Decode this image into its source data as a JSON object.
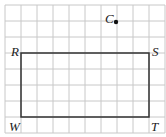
{
  "diagram": {
    "grid": {
      "cols": 10,
      "rows": 8,
      "cell": 16,
      "x0": 5,
      "y0": 5
    },
    "rectangle": {
      "vertices": [
        "R",
        "S",
        "T",
        "W"
      ]
    },
    "labels": {
      "R": "R",
      "S": "S",
      "T": "T",
      "W": "W",
      "C": "C"
    },
    "point": {
      "name": "C"
    }
  }
}
